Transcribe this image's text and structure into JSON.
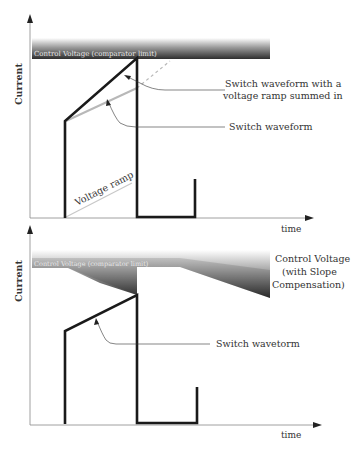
{
  "top_chart": {
    "y_axis_label": "Current",
    "x_axis_label": "time",
    "control_band_label": "Control Voltage (comparator limit)",
    "annotation_summed": [
      "Switch waveform with a",
      "voltage ramp summed in"
    ],
    "annotation_switch": "Switch waveform",
    "ramp_label": "Voltage ramp"
  },
  "bottom_chart": {
    "y_axis_label": "Current",
    "x_axis_label": "time",
    "control_band_label": "Control Voltage (comparator limit)",
    "annotation_control": [
      "Control Voltage",
      "(with Slope",
      "Compensation)"
    ],
    "annotation_switch": "Switch wavetorm"
  },
  "colors": {
    "waveform": "#1a1a1a",
    "ramp": "#bbbbbb",
    "axis": "#888888",
    "band_dark": "#3a3a3a",
    "band_light": "#ffffff"
  }
}
